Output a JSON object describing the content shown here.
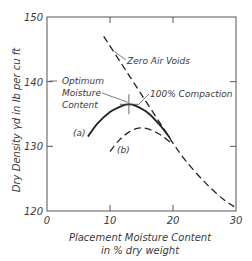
{
  "chart_data": {
    "type": "line",
    "title": "",
    "xlabel": [
      "Placement Moisture Content",
      "in % dry weight"
    ],
    "ylabel": "Dry Density γd in lb per cu ft",
    "xlim": [
      0,
      30
    ],
    "ylim": [
      120,
      150
    ],
    "xticks": [
      0,
      10,
      20,
      30
    ],
    "yticks": [
      120,
      130,
      140,
      150
    ],
    "grid": false,
    "series": [
      {
        "name": "Zero Air Voids",
        "style": "dashed",
        "points": [
          [
            9,
            147
          ],
          [
            12,
            142.5
          ],
          [
            15,
            138
          ],
          [
            18,
            133.5
          ],
          [
            20,
            130.5
          ],
          [
            22,
            127.8
          ],
          [
            25,
            124.5
          ],
          [
            28,
            121.8
          ],
          [
            30,
            120.5
          ]
        ]
      },
      {
        "name": "(a) 100% Compaction",
        "style": "solid",
        "points": [
          [
            6.5,
            131.5
          ],
          [
            8,
            133.5
          ],
          [
            10,
            135.3
          ],
          [
            12,
            136.3
          ],
          [
            13,
            136.5
          ],
          [
            14,
            136.3
          ],
          [
            16,
            135.2
          ],
          [
            18,
            133.2
          ],
          [
            19.5,
            131.3
          ]
        ]
      },
      {
        "name": "(b)",
        "style": "dashed",
        "points": [
          [
            10,
            129.2
          ],
          [
            11.5,
            131
          ],
          [
            13,
            132.2
          ],
          [
            14.5,
            132.8
          ],
          [
            16,
            132.7
          ],
          [
            18,
            131.8
          ],
          [
            20,
            130.3
          ]
        ]
      }
    ],
    "annotations": [
      {
        "text": "Zero Air Voids",
        "target": [
          10.5,
          145
        ]
      },
      {
        "text": "100% Compaction",
        "target": [
          14.4,
          136.2
        ]
      },
      {
        "text": [
          "Optimum",
          "Moisture",
          "Content"
        ],
        "target": [
          13,
          136.5
        ]
      },
      {
        "text": "(a)",
        "near": [
          6.5,
          132
        ]
      },
      {
        "text": "(b)",
        "near": [
          11,
          129
        ]
      }
    ],
    "optimum_marker": {
      "x": 13,
      "y": 136.5
    }
  }
}
